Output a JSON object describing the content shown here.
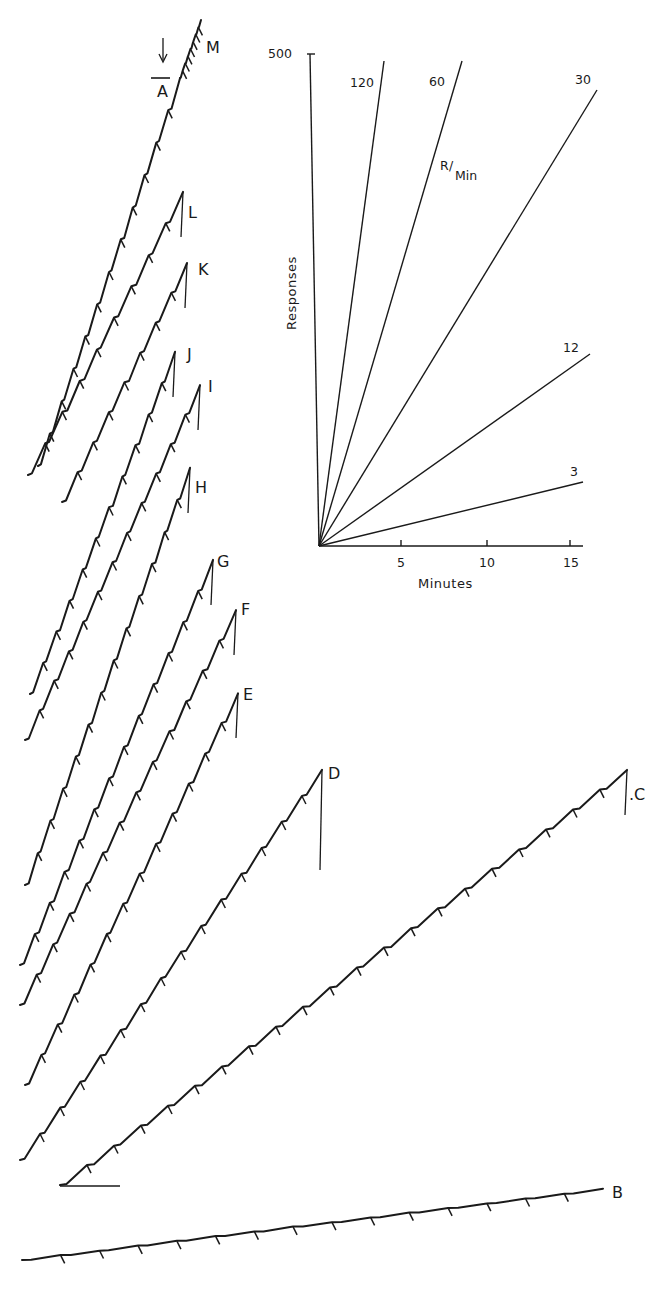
{
  "chart_data": {
    "type": "line",
    "title": "",
    "inset": {
      "ylabel": "Responses",
      "xlabel": "Minutes",
      "y_tick_labels": [
        "500"
      ],
      "x_tick_labels": [
        "5",
        "10",
        "15"
      ],
      "xlim": [
        0,
        15
      ],
      "ylim": [
        0,
        500
      ],
      "rate_unit_label": "R/Min",
      "rate_lines": [
        {
          "label": "120",
          "rate": 120
        },
        {
          "label": "60",
          "rate": 60
        },
        {
          "label": "30",
          "rate": 30
        },
        {
          "label": "12",
          "rate": 12
        },
        {
          "label": "3",
          "rate": 3
        }
      ]
    },
    "arrow_annotation": {
      "target": "A",
      "glyph": "↓"
    },
    "series": [
      {
        "name": "A",
        "start": [
          38,
          466
        ],
        "end": [
          180,
          78
        ],
        "approx_rate": "high"
      },
      {
        "name": "M",
        "start": [
          180,
          78
        ],
        "end": [
          201,
          20
        ],
        "approx_rate": "high"
      },
      {
        "name": "L",
        "start": [
          28,
          475
        ],
        "end": [
          183,
          192
        ],
        "approx_rate": "high"
      },
      {
        "name": "K",
        "start": [
          62,
          502
        ],
        "end": [
          187,
          263
        ],
        "approx_rate": "high"
      },
      {
        "name": "J",
        "start": [
          30,
          694
        ],
        "end": [
          175,
          352
        ],
        "approx_rate": "high"
      },
      {
        "name": "I",
        "start": [
          25,
          740
        ],
        "end": [
          200,
          385
        ],
        "approx_rate": "high"
      },
      {
        "name": "H",
        "start": [
          25,
          885
        ],
        "end": [
          190,
          468
        ],
        "approx_rate": "high"
      },
      {
        "name": "G",
        "start": [
          20,
          965
        ],
        "end": [
          213,
          560
        ],
        "approx_rate": "high"
      },
      {
        "name": "F",
        "start": [
          20,
          1005
        ],
        "end": [
          236,
          610
        ],
        "approx_rate": "high"
      },
      {
        "name": "E",
        "start": [
          25,
          1085
        ],
        "end": [
          238,
          693
        ],
        "approx_rate": "high"
      },
      {
        "name": "D",
        "start": [
          20,
          1160
        ],
        "end": [
          322,
          770
        ],
        "approx_rate": "moderate"
      },
      {
        "name": "C",
        "start": [
          60,
          1185
        ],
        "end": [
          627,
          770
        ],
        "approx_rate": "low-then-accelerating"
      },
      {
        "name": "B",
        "start": [
          22,
          1260
        ],
        "end": [
          603,
          1189
        ],
        "approx_rate": "very low"
      }
    ]
  },
  "labels": {
    "A": "A",
    "B": "B",
    "C": ".C",
    "D": "D",
    "E": "E",
    "F": "F",
    "G": "G",
    "H": "H",
    "I": "I",
    "J": "J",
    "K": "K",
    "L": "L",
    "M": "M",
    "arrow": "↓",
    "y_tick_500": "500",
    "x_tick_5": "5",
    "x_tick_10": "10",
    "x_tick_15": "15",
    "ylabel": "Responses",
    "xlabel": "Minutes",
    "rate_120": "120",
    "rate_60": "60",
    "rate_30": "30",
    "rate_12": "12",
    "rate_3": "3",
    "rate_unit_R": "R",
    "rate_unit_min": "Min"
  }
}
